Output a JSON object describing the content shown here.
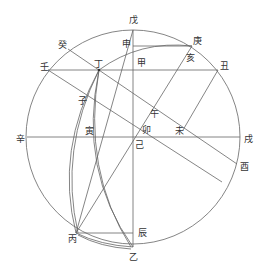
{
  "diagram": {
    "stroke_color": "#555555",
    "circle": {
      "cx": 133,
      "cy": 137,
      "r": 107
    },
    "labels": [
      {
        "id": "wu-top",
        "text": "戊",
        "x": 133,
        "y": 20
      },
      {
        "id": "shen",
        "text": "申",
        "x": 126,
        "y": 44
      },
      {
        "id": "geng",
        "text": "庚",
        "x": 197,
        "y": 41
      },
      {
        "id": "gui",
        "text": "癸",
        "x": 62,
        "y": 45
      },
      {
        "id": "ren",
        "text": "壬",
        "x": 44,
        "y": 67
      },
      {
        "id": "ding",
        "text": "丁",
        "x": 98,
        "y": 64
      },
      {
        "id": "jia",
        "text": "甲",
        "x": 141,
        "y": 70
      },
      {
        "id": "hai",
        "text": "亥",
        "x": 190,
        "y": 62
      },
      {
        "id": "chou",
        "text": "丑",
        "x": 224,
        "y": 66
      },
      {
        "id": "zi",
        "text": "子",
        "x": 82,
        "y": 101
      },
      {
        "id": "wu-noon",
        "text": "午",
        "x": 154,
        "y": 114
      },
      {
        "id": "yin",
        "text": "寅",
        "x": 89,
        "y": 131
      },
      {
        "id": "mao",
        "text": "卯",
        "x": 146,
        "y": 130
      },
      {
        "id": "wei",
        "text": "未",
        "x": 179,
        "y": 132
      },
      {
        "id": "xin",
        "text": "辛",
        "x": 20,
        "y": 139
      },
      {
        "id": "ji",
        "text": "己",
        "x": 139,
        "y": 145
      },
      {
        "id": "xu",
        "text": "戌",
        "x": 248,
        "y": 139
      },
      {
        "id": "you",
        "text": "酉",
        "x": 244,
        "y": 167
      },
      {
        "id": "chen",
        "text": "辰",
        "x": 142,
        "y": 233
      },
      {
        "id": "bing",
        "text": "丙",
        "x": 72,
        "y": 239
      },
      {
        "id": "yi",
        "text": "乙",
        "x": 133,
        "y": 257
      }
    ]
  }
}
